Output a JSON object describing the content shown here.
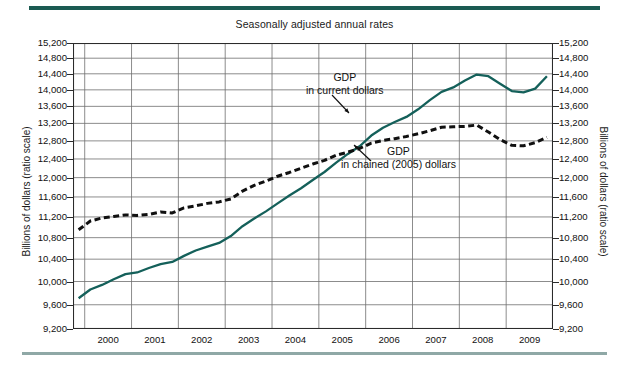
{
  "figure": {
    "title": "Seasonally adjusted annual rates",
    "y_axis_label_left": "Billions of dollars (ratio scale)",
    "y_axis_label_right": "Billions of dollars (ratio scale)",
    "accent_color": "#1b5b52",
    "rule_color_bottom": "#8fa8a6",
    "series_solid_color": "#14605a",
    "series_dashed_color": "#101010"
  },
  "annotations": [
    {
      "line1": "GDP",
      "line2": "in current dollars"
    },
    {
      "line1": "GDP",
      "line2": "in chained (2005) dollars"
    }
  ],
  "chart_data": {
    "type": "line",
    "title": "Seasonally adjusted annual rates",
    "xlabel": "",
    "ylabel": "Billions of dollars (ratio scale)",
    "yscale": "log",
    "ylim": [
      9200,
      15200
    ],
    "xlim": [
      1999.75,
      2010.0
    ],
    "grid": true,
    "legend_position": "inline-annotations",
    "yticks": [
      9200,
      9600,
      10000,
      10400,
      10800,
      11200,
      11600,
      12000,
      12400,
      12800,
      13200,
      13600,
      14000,
      14400,
      14800,
      15200
    ],
    "ytick_labels": [
      "9,200",
      "9,600",
      "10,000",
      "10,400",
      "10,800",
      "11,200",
      "11,600",
      "12,000",
      "12,400",
      "12,800",
      "13,200",
      "13,600",
      "14,000",
      "14,400",
      "14,800",
      "15,200"
    ],
    "xticks": [
      2000,
      2001,
      2002,
      2003,
      2004,
      2005,
      2006,
      2007,
      2008,
      2009
    ],
    "xtick_labels": [
      "2000",
      "2001",
      "2002",
      "2003",
      "2004",
      "2005",
      "2006",
      "2007",
      "2008",
      "2009"
    ],
    "series": [
      {
        "name": "GDP in current dollars",
        "style": "solid",
        "color": "#14605a",
        "x": [
          1999.87,
          2000.12,
          2000.37,
          2000.62,
          2000.87,
          2001.12,
          2001.37,
          2001.62,
          2001.87,
          2002.12,
          2002.37,
          2002.62,
          2002.87,
          2003.12,
          2003.37,
          2003.62,
          2003.87,
          2004.12,
          2004.37,
          2004.62,
          2004.87,
          2005.12,
          2005.37,
          2005.62,
          2005.87,
          2006.12,
          2006.37,
          2006.62,
          2006.87,
          2007.12,
          2007.37,
          2007.62,
          2007.87,
          2008.12,
          2008.37,
          2008.62,
          2008.87,
          2009.12,
          2009.37,
          2009.62,
          2009.87
        ],
        "y": [
          9710,
          9860,
          9940,
          10040,
          10130,
          10160,
          10240,
          10310,
          10350,
          10460,
          10560,
          10630,
          10700,
          10830,
          11020,
          11170,
          11310,
          11470,
          11630,
          11780,
          11950,
          12120,
          12320,
          12510,
          12680,
          12920,
          13100,
          13230,
          13350,
          13530,
          13750,
          13950,
          14060,
          14230,
          14380,
          14340,
          14150,
          13970,
          13940,
          14030,
          14340
        ]
      },
      {
        "name": "GDP in chained (2005) dollars",
        "style": "dashed",
        "color": "#101010",
        "x": [
          1999.87,
          2000.12,
          2000.37,
          2000.62,
          2000.87,
          2001.12,
          2001.37,
          2001.62,
          2001.87,
          2002.12,
          2002.37,
          2002.62,
          2002.87,
          2003.12,
          2003.37,
          2003.62,
          2003.87,
          2004.12,
          2004.37,
          2004.62,
          2004.87,
          2005.12,
          2005.37,
          2005.62,
          2005.87,
          2006.12,
          2006.37,
          2006.62,
          2006.87,
          2007.12,
          2007.37,
          2007.62,
          2007.87,
          2008.12,
          2008.37,
          2008.62,
          2008.87,
          2009.12,
          2009.37,
          2009.62,
          2009.87
        ],
        "y": [
          10950,
          11120,
          11180,
          11210,
          11240,
          11230,
          11250,
          11300,
          11280,
          11380,
          11420,
          11470,
          11500,
          11560,
          11720,
          11840,
          11930,
          12030,
          12110,
          12200,
          12290,
          12370,
          12480,
          12550,
          12630,
          12750,
          12810,
          12850,
          12900,
          12960,
          13030,
          13110,
          13120,
          13130,
          13160,
          13000,
          12830,
          12700,
          12690,
          12760,
          12880
        ]
      }
    ],
    "annotations": [
      {
        "text": "GDP in current dollars",
        "points_to_series": "GDP in current dollars"
      },
      {
        "text": "GDP in chained (2005) dollars",
        "points_to_series": "GDP in chained (2005) dollars"
      }
    ]
  }
}
